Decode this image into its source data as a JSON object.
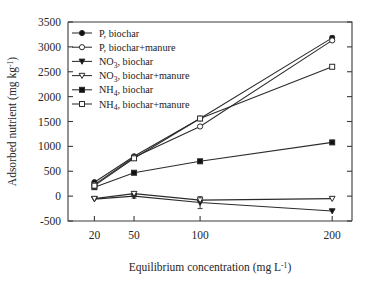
{
  "chart_data": {
    "type": "line",
    "title": "",
    "xlabel": "Equilibrium concentration (mg L-1)",
    "ylabel": "Adsorbed nutrient (mg kg-1)",
    "x": [
      20,
      50,
      100,
      200
    ],
    "xtick_labels": [
      "20",
      "50",
      "100",
      "200"
    ],
    "xlim": [
      0,
      215
    ],
    "ylim": [
      -500,
      3500
    ],
    "ytick_labels": [
      "-500",
      "0",
      "500",
      "1000",
      "1500",
      "2000",
      "2500",
      "3000",
      "3500"
    ],
    "ytick_values": [
      -500,
      0,
      500,
      1000,
      1500,
      2000,
      2500,
      3000,
      3500
    ],
    "grid": false,
    "legend_position": "top-left inside",
    "series": [
      {
        "name": "P, biochar",
        "marker": "filled-circle",
        "values": [
          280,
          800,
          1560,
          3180
        ],
        "errors": [
          0,
          0,
          0,
          40
        ]
      },
      {
        "name": "P, biochar+manure",
        "marker": "open-circle",
        "values": [
          230,
          780,
          1400,
          3130
        ],
        "errors": [
          0,
          0,
          0,
          0
        ]
      },
      {
        "name": "NO3, biochar",
        "marker": "filled-triangle-down",
        "values": [
          -60,
          0,
          -130,
          -300
        ],
        "errors": [
          0,
          40,
          120,
          0
        ]
      },
      {
        "name": "NO3, biochar+manure",
        "marker": "open-triangle-down",
        "values": [
          -50,
          50,
          -80,
          -50
        ],
        "errors": [
          0,
          40,
          0,
          0
        ]
      },
      {
        "name": "NH4, biochar",
        "marker": "filled-square",
        "values": [
          180,
          470,
          700,
          1080
        ],
        "errors": [
          0,
          0,
          0,
          0
        ]
      },
      {
        "name": "NH4, biochar+manure",
        "marker": "open-square",
        "values": [
          210,
          760,
          1560,
          2600
        ],
        "errors": [
          0,
          0,
          0,
          0
        ]
      }
    ]
  },
  "axes": {
    "ylabel_main": "Adsorbed nutrient (mg kg",
    "ylabel_sup": "-1",
    "ylabel_tail": ")",
    "xlabel_main": "Equilibrium concentration (mg L",
    "xlabel_sup": "-1",
    "xlabel_tail": ")"
  },
  "legend": {
    "entries": [
      {
        "prefix": "P, biochar",
        "sub": "",
        "suffix": ""
      },
      {
        "prefix": "P, biochar+manure",
        "sub": "",
        "suffix": ""
      },
      {
        "prefix": "NO",
        "sub": "3",
        "suffix": ", biochar"
      },
      {
        "prefix": "NO",
        "sub": "3",
        "suffix": ", biochar+manure"
      },
      {
        "prefix": "NH",
        "sub": "4",
        "suffix": ", biochar"
      },
      {
        "prefix": "NH",
        "sub": "4",
        "suffix": ", biochar+manure"
      }
    ]
  },
  "colors": {
    "line": "#2b2b2b",
    "marker_fill": "#111111",
    "marker_open": "#ffffff",
    "axis": "#3a3a3a",
    "background": "#ffffff"
  }
}
